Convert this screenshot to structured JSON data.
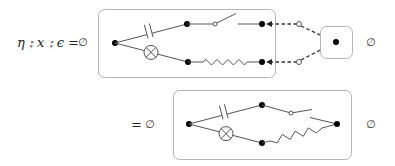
{
  "equation_top": {
    "lhs": "η ⨟ x ⨟ ϵ",
    "equals": "=",
    "empty_left": "∅",
    "empty_right": "∅"
  },
  "equation_bottom": {
    "equals": "=",
    "empty_left": "∅",
    "empty_right": "∅"
  },
  "diagram_top": {
    "components": [
      "capacitor",
      "lamp",
      "switch",
      "resistor"
    ],
    "cup_box_components": [
      "node"
    ],
    "connections": "dashed arrows from two open terminals converging to single node"
  },
  "diagram_bottom": {
    "components": [
      "capacitor",
      "lamp",
      "switch",
      "resistor"
    ]
  }
}
